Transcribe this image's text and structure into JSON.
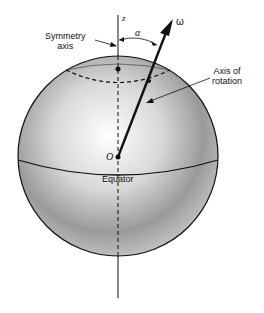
{
  "labels": {
    "z_axis": "z",
    "omega": "ω",
    "alpha": "α",
    "symmetry_axis_line1": "Symmetry",
    "symmetry_axis_line2": "axis",
    "rotation_axis_line1": "Axis of",
    "rotation_axis_line2": "rotation",
    "origin": "O",
    "equator": "Equator"
  },
  "colors": {
    "stroke": "#111111",
    "sphere_light": "#ffffff",
    "sphere_dark": "#8a8a8a"
  }
}
